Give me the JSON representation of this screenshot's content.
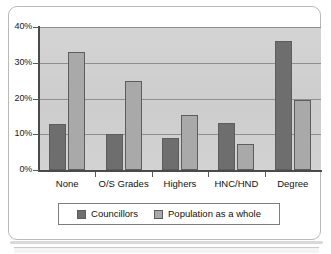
{
  "chart_data": {
    "type": "bar",
    "title": "",
    "subtitle": "",
    "xlabel": "",
    "ylabel": "",
    "categories": [
      "None",
      "O/S Grades",
      "Highers",
      "HNC/HND",
      "Degree"
    ],
    "series": [
      {
        "name": "Councillors",
        "color": "#6e6e6e",
        "values": [
          13,
          10,
          9,
          13.2,
          36
        ]
      },
      {
        "name": "Population as a whole",
        "color": "#a9a9a9",
        "values": [
          33,
          25,
          15.5,
          7.2,
          19.5
        ]
      }
    ],
    "ylim": [
      0,
      40
    ],
    "yticks": [
      0,
      10,
      20,
      30,
      40
    ],
    "ytick_labels": [
      "0%",
      "10%",
      "20%",
      "30%",
      "40%"
    ],
    "grid": true,
    "grid_axis": "y",
    "legend_position": "bottom",
    "plot_background": "#d0d0d0",
    "axis_color": "#4a4a4a",
    "gridline_color": "#8f8f8f"
  }
}
